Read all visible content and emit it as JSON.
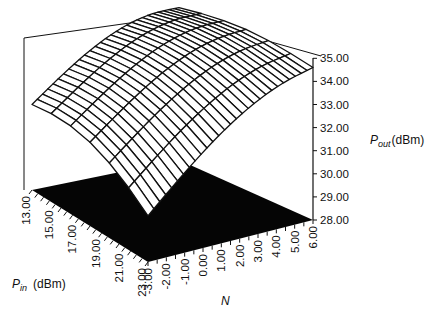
{
  "chart_data": {
    "type": "surface3d",
    "title": "",
    "z_axis": {
      "label_main": "P",
      "label_sub": "out",
      "label_unit": "(dBm)",
      "ticks": [
        "35.00",
        "34.00",
        "33.00",
        "32.00",
        "31.00",
        "30.00",
        "29.00",
        "28.00"
      ],
      "range": [
        28,
        35
      ]
    },
    "x_axis": {
      "label_main": "P",
      "label_sub": "in",
      "label_unit": "(dBm)",
      "ticks": [
        "13.00",
        "15.00",
        "17.00",
        "19.00",
        "21.00",
        "23.00"
      ],
      "range": [
        13,
        23
      ]
    },
    "y_axis": {
      "label": "N",
      "ticks": [
        "-3.00",
        "-2.00",
        "-1.00",
        "0.00",
        "1.00",
        "2.00",
        "3.00",
        "4.00",
        "5.00",
        "6.00"
      ],
      "range": [
        -3,
        6
      ]
    },
    "surface_description": "Wireframe dome surface; Pout peaks ~34.5 dBm near Pin 13-17 and high N, drops to ~31 dBm at Pin 13/N -3 and ~30 dBm at Pin 23/N -3",
    "sample_points": [
      {
        "pin": 13,
        "n": -3,
        "pout": 31.7
      },
      {
        "pin": 23,
        "n": -3,
        "pout": 30.0
      },
      {
        "pin": 13,
        "n": 6,
        "pout": 34.0
      },
      {
        "pin": 23,
        "n": 6,
        "pout": 34.4
      },
      {
        "pin": 18,
        "n": 3,
        "pout": 34.6
      }
    ],
    "grid": true,
    "floor_color": "#000000",
    "legend": null
  }
}
